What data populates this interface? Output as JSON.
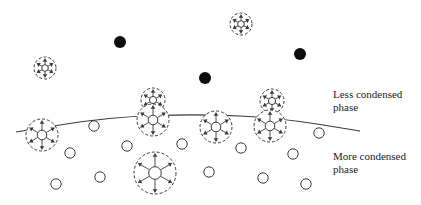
{
  "figure": {
    "type": "phase-interface-schematic",
    "colors": {
      "background": "#ffffff",
      "stroke": "#3a3a3a",
      "filled_dot": "#0d0d0d"
    }
  },
  "labels": {
    "upper_phase": [
      "Less condensed",
      "phase"
    ],
    "lower_phase": [
      "More condensed",
      "phase"
    ]
  },
  "interface_curve": {
    "points": [
      [
        16,
        132
      ],
      [
        110,
        117
      ],
      [
        200,
        114
      ],
      [
        280,
        118
      ],
      [
        360,
        131
      ]
    ]
  },
  "filled_dots": [
    {
      "x": 120,
      "y": 42,
      "r": 6
    },
    {
      "x": 205,
      "y": 78,
      "r": 6
    },
    {
      "x": 300,
      "y": 54,
      "r": 6
    }
  ],
  "expanded_molecules": [
    {
      "name": "free-molecule-left",
      "x": 45,
      "y": 68,
      "r": 11
    },
    {
      "name": "free-molecule-top",
      "x": 241,
      "y": 24,
      "r": 11
    },
    {
      "name": "interface-molecule-left",
      "x": 42,
      "y": 135,
      "r": 16
    },
    {
      "name": "interface-molecule-stack-a-upper",
      "x": 153,
      "y": 100,
      "r": 12
    },
    {
      "name": "interface-molecule-stack-a-lower",
      "x": 153,
      "y": 120,
      "r": 16
    },
    {
      "name": "interface-molecule-center",
      "x": 216,
      "y": 127,
      "r": 16
    },
    {
      "name": "interface-molecule-stack-b-upper",
      "x": 272,
      "y": 101,
      "r": 12
    },
    {
      "name": "interface-molecule-stack-b-lower",
      "x": 270,
      "y": 126,
      "r": 16
    },
    {
      "name": "bulk-molecule-large",
      "x": 155,
      "y": 173,
      "r": 21
    }
  ],
  "open_circles": [
    {
      "x": 94,
      "y": 126
    },
    {
      "x": 70,
      "y": 153
    },
    {
      "x": 127,
      "y": 146
    },
    {
      "x": 182,
      "y": 144
    },
    {
      "x": 56,
      "y": 184
    },
    {
      "x": 100,
      "y": 177
    },
    {
      "x": 209,
      "y": 172
    },
    {
      "x": 241,
      "y": 148
    },
    {
      "x": 263,
      "y": 178
    },
    {
      "x": 293,
      "y": 154
    },
    {
      "x": 319,
      "y": 133
    },
    {
      "x": 306,
      "y": 184
    }
  ]
}
